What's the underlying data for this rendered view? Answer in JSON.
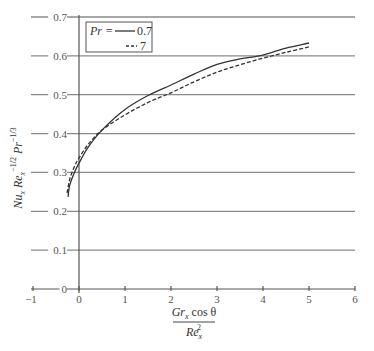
{
  "chart_data": {
    "type": "line",
    "title": "",
    "xlabel": {
      "numerator": "Gr_x cos θ",
      "denominator": "Re_x^2",
      "parts": {
        "num_main": "Gr",
        "num_sub": "x",
        "num_rest": " cos θ",
        "den_main": "Re",
        "den_sub": "x",
        "den_sup": "2"
      }
    },
    "ylabel": {
      "text": "Nu_x Re_x^-1/2 Pr^-1/3",
      "parts": {
        "a": "Nu",
        "a_sub": "x",
        "b": " Re",
        "b_sub": "x",
        "b_sup": "−1/2",
        "c": " Pr",
        "c_sup": "−1/3"
      }
    },
    "xlim": [
      -1,
      6
    ],
    "ylim": [
      0,
      0.7
    ],
    "x_ticks": [
      -1,
      0,
      1,
      2,
      3,
      4,
      5,
      6
    ],
    "x_tick_labels": [
      "−1",
      "0",
      "1",
      "2",
      "3",
      "4",
      "5",
      "6"
    ],
    "y_ticks": [
      0,
      0.1,
      0.2,
      0.3,
      0.4,
      0.5,
      0.6,
      0.7
    ],
    "y_tick_labels": [
      "0",
      "0.1",
      "0.2",
      "0.3",
      "0.4",
      "0.5",
      "0.6",
      "0.7"
    ],
    "grid": {
      "horizontal": true,
      "vertical": false
    },
    "legend": {
      "position": "upper-left",
      "title": "Pr =",
      "entries": [
        {
          "label": "0.7",
          "style": "solid"
        },
        {
          "label": "7",
          "style": "dashed"
        }
      ]
    },
    "series": [
      {
        "name": "Pr = 0.7",
        "style": "solid",
        "x": [
          -0.24,
          -0.2,
          -0.1,
          0,
          0.2,
          0.5,
          1.0,
          1.5,
          2.0,
          2.5,
          3.0,
          3.5,
          4.0,
          4.5,
          5.0
        ],
        "y": [
          0.237,
          0.268,
          0.3,
          0.324,
          0.365,
          0.409,
          0.462,
          0.498,
          0.525,
          0.553,
          0.578,
          0.592,
          0.602,
          0.62,
          0.633
        ]
      },
      {
        "name": "Pr = 7",
        "style": "dashed",
        "x": [
          -0.26,
          -0.2,
          -0.1,
          0,
          0.2,
          0.5,
          1.0,
          1.5,
          2.0,
          2.5,
          3.0,
          3.5,
          4.0,
          4.5,
          5.0
        ],
        "y": [
          0.247,
          0.283,
          0.315,
          0.337,
          0.372,
          0.409,
          0.448,
          0.48,
          0.505,
          0.533,
          0.558,
          0.577,
          0.594,
          0.609,
          0.623
        ]
      }
    ]
  }
}
